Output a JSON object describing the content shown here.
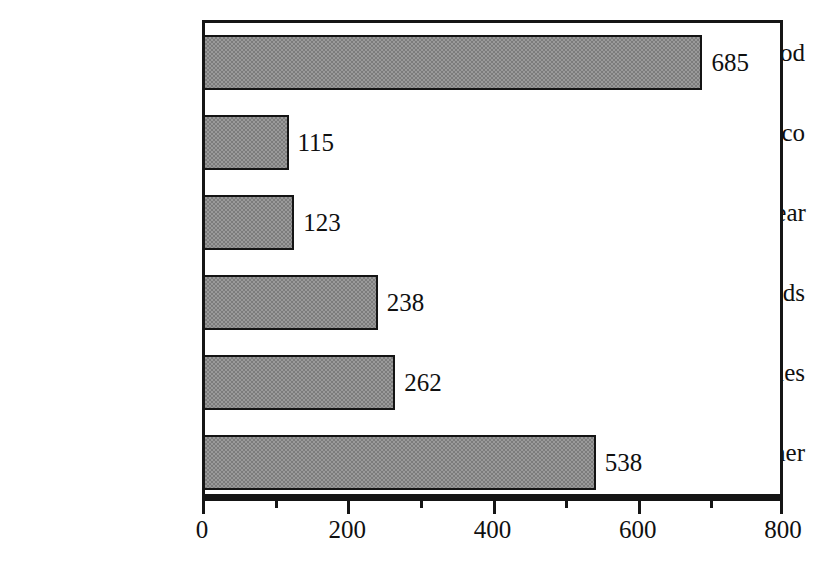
{
  "chart_data": {
    "type": "bar",
    "orientation": "horizontal",
    "title": "",
    "subtitle": "",
    "xlabel": "",
    "ylabel": "",
    "categories": [
      "Food",
      "Sweets, tobacco",
      "Clothing, footwear",
      "Household goods",
      "Motor vehicles",
      "Other"
    ],
    "values": [
      685,
      115,
      123,
      238,
      262,
      538
    ],
    "value_labels": [
      "685",
      "115",
      "123",
      "238",
      "262",
      "538"
    ],
    "xlim": [
      0,
      800
    ],
    "x_ticks": [
      0,
      200,
      400,
      600,
      800
    ],
    "x_tick_labels": [
      "0",
      "200",
      "400",
      "600",
      "800"
    ],
    "x_minor_ticks": [
      100,
      300,
      500,
      700
    ],
    "grid": false,
    "legend": null,
    "annotations": [],
    "colors": {
      "bar_fill": "#9a9a9a",
      "bar_pattern": "#7c7c7c",
      "bar_border": "#141414",
      "axis": "#151515",
      "text": "#101010",
      "background": "#ffffff"
    }
  }
}
